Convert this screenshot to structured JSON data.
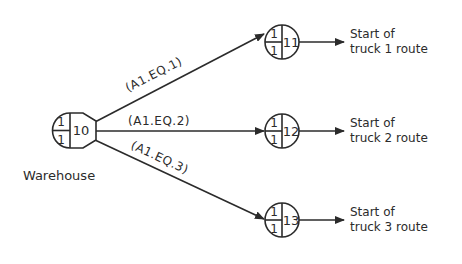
{
  "diagram": {
    "type": "network",
    "colors": {
      "line": "#2b2b2b",
      "background": "#ffffff"
    },
    "source_node": {
      "id": "10",
      "top_slot": "1",
      "bottom_slot": "1",
      "label": "Warehouse",
      "shape": "semicircle-trapezoid"
    },
    "nodes": [
      {
        "id": "11",
        "top_slot": "1",
        "bottom_slot": "1",
        "destination_line1": "Start of",
        "destination_line2": "truck 1 route"
      },
      {
        "id": "12",
        "top_slot": "1",
        "bottom_slot": "1",
        "destination_line1": "Start of",
        "destination_line2": "truck 2 route"
      },
      {
        "id": "13",
        "top_slot": "1",
        "bottom_slot": "1",
        "destination_line1": "Start of",
        "destination_line2": "truck 3 route"
      }
    ],
    "edges": [
      {
        "from": "10",
        "to": "11",
        "label": "(A1.EQ.1)"
      },
      {
        "from": "10",
        "to": "12",
        "label": "(A1.EQ.2)"
      },
      {
        "from": "10",
        "to": "13",
        "label": "(A1.EQ.3)"
      }
    ]
  }
}
